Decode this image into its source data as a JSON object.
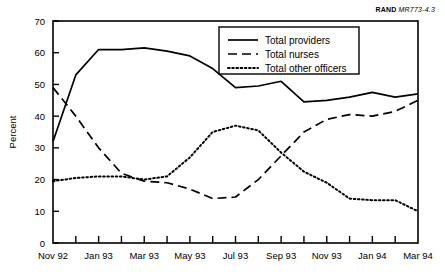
{
  "source_label": {
    "org": "RAND",
    "document": "MR773-4.3"
  },
  "chart_data": {
    "type": "line",
    "title": "",
    "subtitle": "",
    "xlabel": "",
    "ylabel": "Percent",
    "ylim": [
      0,
      70
    ],
    "ytick_values": [
      0,
      10,
      20,
      30,
      40,
      50,
      60,
      70
    ],
    "ytick_labels": [
      "0",
      "10",
      "20",
      "30",
      "40",
      "50",
      "60",
      "70"
    ],
    "grid": false,
    "legend_position": "top-center",
    "x": [
      "Nov 92",
      "Dec 92",
      "Jan 93",
      "Feb 93",
      "Mar 93",
      "Apr 93",
      "May 93",
      "Jun 93",
      "Jul 93",
      "Aug 93",
      "Sep 93",
      "Oct 93",
      "Nov 93",
      "Dec 93",
      "Jan 94",
      "Feb 94",
      "Mar 94"
    ],
    "xtick_labels": [
      "Nov 92",
      "Jan 93",
      "Mar 93",
      "May 93",
      "Jul 93",
      "Sep 93",
      "Nov 93",
      "Jan 94",
      "Mar 94"
    ],
    "xtick_indices": [
      0,
      2,
      4,
      6,
      8,
      10,
      12,
      14,
      16
    ],
    "series": [
      {
        "name": "Total providers",
        "style": "solid",
        "values": [
          32,
          53,
          61,
          61,
          61.5,
          60.5,
          59,
          55,
          49,
          49.5,
          51,
          44.5,
          45,
          46,
          47.5,
          46,
          47
        ]
      },
      {
        "name": "Total nurses",
        "style": "dashed",
        "values": [
          49,
          40,
          30,
          22,
          19.5,
          19,
          17,
          14,
          14.5,
          20,
          27.5,
          35,
          39,
          40.5,
          40,
          41.5,
          45
        ]
      },
      {
        "name": "Total other officers",
        "style": "dotted",
        "values": [
          19.5,
          20.5,
          21,
          21,
          20,
          21,
          27,
          35,
          37,
          35.5,
          28.5,
          22.5,
          19,
          14,
          13.5,
          13.5,
          10
        ]
      }
    ]
  },
  "legend": {
    "items": [
      {
        "label": "Total providers",
        "style": "solid"
      },
      {
        "label": "Total nurses",
        "style": "dashed"
      },
      {
        "label": "Total other officers",
        "style": "dotted"
      }
    ]
  }
}
